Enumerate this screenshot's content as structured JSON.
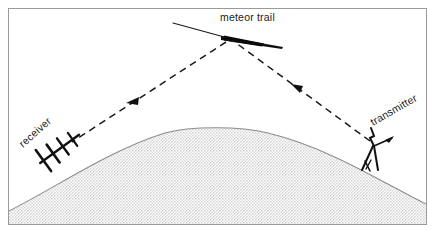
{
  "figure": {
    "name": "meteor-scatter-propagation-diagram",
    "type": "diagram",
    "background_color": "#ffffff",
    "frame": {
      "color": "#9a9a9a",
      "x": 8,
      "y": 8,
      "width": 419,
      "height": 217
    },
    "labels": {
      "meteor_trail": "meteor trail",
      "receiver": "receiver",
      "transmitter": "transmitter"
    },
    "colors": {
      "ink": "#1a1a1a",
      "earth_fill": "#e8e8e8",
      "earth_stroke": "#8c8c8c",
      "dash_stroke": "#1a1a1a",
      "frame": "#9a9a9a"
    },
    "earth": {
      "description": "curved earth surface, halftone shaded",
      "apex_x": 215,
      "apex_y": 127,
      "left_edge_y": 210,
      "right_edge_y": 203
    },
    "meteor": {
      "description": "meteor trail streak thickening to the right",
      "start_x": 173,
      "start_y": 23,
      "end_x": 283,
      "end_y": 46,
      "reflection_x": 228,
      "reflection_y": 38
    },
    "paths": {
      "uplink": {
        "label": "transmitter-to-meteor-dashed-path",
        "from_x": 372,
        "from_y": 143,
        "to_x": 231,
        "to_y": 40,
        "arrow_direction": "toward-meteor"
      },
      "downlink": {
        "label": "meteor-to-receiver-dashed-path",
        "from_x": 226,
        "from_y": 41,
        "to_x": 70,
        "to_y": 142,
        "arrow_direction": "toward-receiver"
      }
    },
    "antennas": {
      "receiver": {
        "type": "yagi-antenna",
        "x": 58,
        "y": 150,
        "rotation_deg": -38
      },
      "transmitter": {
        "type": "mast-antenna",
        "x": 373,
        "y": 152,
        "rotation_deg": 0
      }
    }
  }
}
